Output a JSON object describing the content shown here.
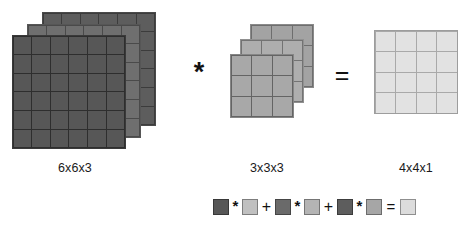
{
  "diagram": {
    "operator_convolve": "*",
    "operator_equals": "=",
    "input": {
      "label": "6x6x3",
      "rows": 6,
      "cols": 6,
      "depth": 3,
      "colors": [
        "#5d5d5d",
        "#6f6f6f",
        "#575757"
      ]
    },
    "kernel": {
      "label": "3x3x3",
      "rows": 3,
      "cols": 3,
      "depth": 3,
      "colors": [
        "#a3a3a3",
        "#aeaeae",
        "#a8a8a8"
      ]
    },
    "output": {
      "label": "4x4x1",
      "rows": 4,
      "cols": 4,
      "depth": 1,
      "colors": [
        "#e2e2e2"
      ]
    }
  },
  "legend": {
    "description": "Per-channel element-wise products summed to a single output value",
    "terms": [
      {
        "input_color": "#575757",
        "kernel_color": "#c0c0c0",
        "times": "*"
      },
      {
        "input_color": "#6a6a6a",
        "kernel_color": "#b4b4b4",
        "times": "*"
      },
      {
        "input_color": "#5d5d5d",
        "kernel_color": "#a6a6a6",
        "times": "*"
      }
    ],
    "plus": "+",
    "equals": "=",
    "result_color": "#dcdcdc"
  }
}
